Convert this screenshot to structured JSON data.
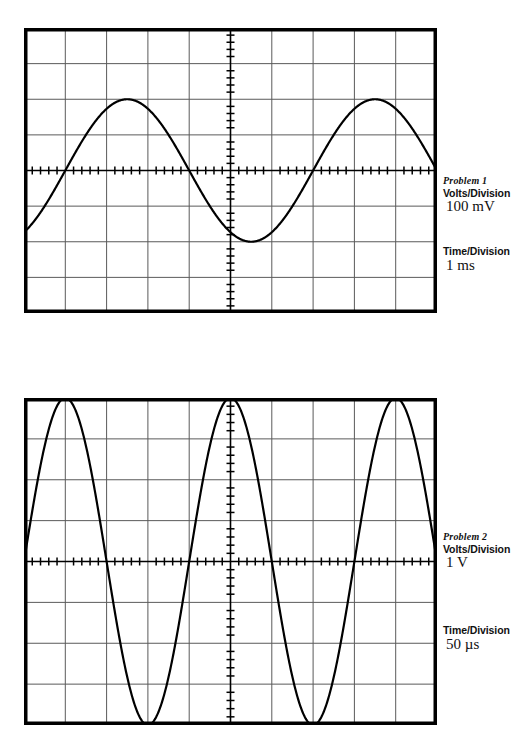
{
  "page": {
    "background_color": "#ffffff",
    "trace_color": "#000000",
    "grid_color": "#5a5a5a",
    "border_color": "#000000",
    "width": 522,
    "height": 754
  },
  "scopes": [
    {
      "id": "problem-1",
      "title": "Problem 1",
      "volts_label": "Volts/Division",
      "volts_value": "100 mV",
      "time_label": "Time/Division",
      "time_value": "1 ms",
      "screen": {
        "x": 24,
        "y": 28,
        "width": 413,
        "height": 285
      },
      "grid": {
        "divisions_x": 10,
        "divisions_y": 8,
        "subticks_per_division": 5
      },
      "label_block": {
        "x": 443,
        "title_y": 175,
        "volts_y": 187,
        "value_y": 198,
        "time_label_y": 245,
        "time_value_y": 257
      }
    },
    {
      "id": "problem-2",
      "title": "Problem 2",
      "volts_label": "Volts/Division",
      "volts_value": "1 V",
      "time_label": "Time/Division",
      "time_value": "50 µs",
      "screen": {
        "x": 24,
        "y": 398,
        "width": 413,
        "height": 327
      },
      "grid": {
        "divisions_x": 10,
        "divisions_y": 8,
        "subticks_per_division": 5
      },
      "label_block": {
        "x": 443,
        "title_y": 531,
        "volts_y": 543,
        "value_y": 554,
        "time_label_y": 624,
        "time_value_y": 636
      }
    }
  ],
  "chart_data": [
    {
      "type": "line",
      "title": "Problem 1",
      "waveform": "sine",
      "xlabel": "Time (divisions)",
      "ylabel": "Voltage (divisions)",
      "xlim": [
        0,
        10
      ],
      "ylim": [
        -4,
        4
      ],
      "grid": true,
      "legend": "none",
      "volts_per_division": "100 mV",
      "time_per_division": "1 ms",
      "amplitude_divisions": 2,
      "period_divisions": 6,
      "phase_zero_crossing_division": 1.0,
      "peak_to_peak_divisions": 4,
      "peak_to_peak_volts": 0.4,
      "period_seconds": 0.006,
      "frequency_hz": 166.7,
      "amplitude_volts": 0.2,
      "x": [
        0.0,
        0.25,
        0.5,
        0.75,
        1.0,
        1.25,
        1.5,
        1.75,
        2.0,
        2.25,
        2.5,
        2.75,
        3.0,
        3.25,
        3.5,
        3.75,
        4.0,
        4.25,
        4.5,
        4.75,
        5.0,
        5.25,
        5.5,
        5.75,
        6.0,
        6.25,
        6.5,
        6.75,
        7.0,
        7.25,
        7.5,
        7.75,
        8.0,
        8.25,
        8.5,
        8.75,
        9.0,
        9.25,
        9.5,
        9.75,
        10.0
      ],
      "y": [
        -1.0,
        -0.77,
        -0.52,
        -0.26,
        0.0,
        0.26,
        0.52,
        0.77,
        1.0,
        1.2,
        1.41,
        1.62,
        1.73,
        1.93,
        1.97,
        1.97,
        1.73,
        1.62,
        1.41,
        1.2,
        1.0,
        0.77,
        0.52,
        0.26,
        0.0,
        -0.26,
        -0.52,
        -0.77,
        -1.0,
        -1.41,
        -1.73,
        -1.93,
        -2.0,
        -1.93,
        -1.73,
        -1.41,
        -1.0,
        -0.52,
        0.0,
        0.52,
        1.0
      ]
    },
    {
      "type": "line",
      "title": "Problem 2",
      "waveform": "sine",
      "xlabel": "Time (divisions)",
      "ylabel": "Voltage (divisions)",
      "xlim": [
        0,
        10
      ],
      "ylim": [
        -4,
        4
      ],
      "grid": true,
      "legend": "none",
      "volts_per_division": "1 V",
      "time_per_division": "50 µs",
      "amplitude_divisions": 4,
      "period_divisions": 4,
      "phase_zero_crossing_division": 0.0,
      "peak_to_peak_divisions": 8,
      "peak_to_peak_volts": 8,
      "period_seconds": 0.0002,
      "frequency_hz": 5000,
      "amplitude_volts": 4,
      "x": [
        0.0,
        0.25,
        0.5,
        0.75,
        1.0,
        1.25,
        1.5,
        1.75,
        2.0,
        2.25,
        2.5,
        2.75,
        3.0,
        3.25,
        3.5,
        3.75,
        4.0,
        4.25,
        4.5,
        4.75,
        5.0,
        5.25,
        5.5,
        5.75,
        6.0,
        6.25,
        6.5,
        6.75,
        7.0,
        7.25,
        7.5,
        7.75,
        8.0,
        8.25,
        8.5,
        8.75,
        9.0,
        9.25,
        9.5,
        9.75,
        10.0
      ],
      "y": [
        0.0,
        1.53,
        2.83,
        3.7,
        4.0,
        3.7,
        2.83,
        1.53,
        0.0,
        -1.53,
        -2.83,
        -3.7,
        -4.0,
        -3.7,
        -2.83,
        -1.53,
        0.0,
        1.53,
        2.83,
        3.7,
        4.0,
        3.7,
        2.83,
        1.53,
        0.0,
        -1.53,
        -2.83,
        -3.7,
        -4.0,
        -3.7,
        -2.83,
        -1.53,
        0.0,
        1.53,
        2.83,
        3.7,
        4.0,
        3.7,
        2.83,
        1.53,
        0.0
      ]
    }
  ]
}
